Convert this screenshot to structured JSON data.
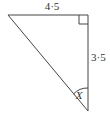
{
  "diagram": {
    "type": "right-triangle",
    "labels": {
      "top_side": "4·5",
      "right_side": "3·5",
      "angle": "X"
    },
    "vertices": {
      "top_left": [
        8,
        15
      ],
      "top_right": [
        88,
        15
      ],
      "bottom": [
        88,
        111
      ]
    },
    "right_angle_at": "top_right",
    "stroke_color": "#444444"
  }
}
